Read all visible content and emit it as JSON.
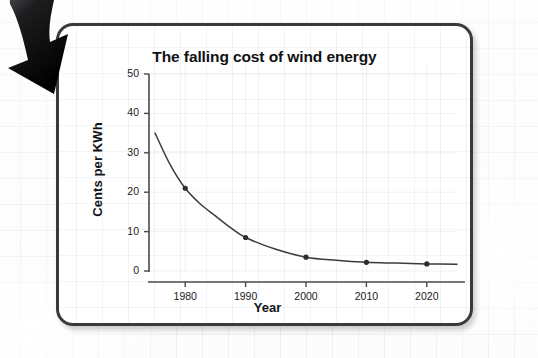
{
  "figure": {
    "card_border_color": "#3a3a3c",
    "card_background": "#ffffff",
    "page_background": "#fcfcfd",
    "arrow_color": "#111111",
    "arrow_name": "curved-down-arrow"
  },
  "chart_data": {
    "type": "line",
    "title": "The falling cost of wind energy",
    "xlabel": "Year",
    "ylabel": "Cents per KWh",
    "xlim": [
      1974,
      2025
    ],
    "ylim": [
      0,
      50
    ],
    "xticks": [
      "1980",
      "1990",
      "2000",
      "2010",
      "2020"
    ],
    "xtick_values": [
      1980,
      1990,
      2000,
      2010,
      2020
    ],
    "yticks": [
      "0",
      "10",
      "20",
      "30",
      "40",
      "50"
    ],
    "ytick_values": [
      0,
      10,
      20,
      30,
      40,
      50
    ],
    "grid": true,
    "legend": "none",
    "line_color": "#3c3c3e",
    "marker_color": "#2e2e30",
    "x": [
      1980,
      1990,
      2000,
      2010,
      2020
    ],
    "values": [
      21,
      8.5,
      3.5,
      2.2,
      1.8
    ],
    "series": [
      {
        "name": "Cost of wind energy",
        "x": [
          1980,
          1990,
          2000,
          2010,
          2020
        ],
        "values": [
          21,
          8.5,
          3.5,
          2.2,
          1.8
        ]
      }
    ],
    "curve_x": [
      1975,
      1977.5,
      1980,
      1982.5,
      1985,
      1987.5,
      1990,
      1995,
      2000,
      2005,
      2010,
      2015,
      2020,
      2025
    ],
    "curve_y": [
      35,
      27,
      21,
      17,
      14,
      11,
      8.5,
      5.5,
      3.5,
      2.7,
      2.2,
      2.0,
      1.8,
      1.7
    ]
  }
}
